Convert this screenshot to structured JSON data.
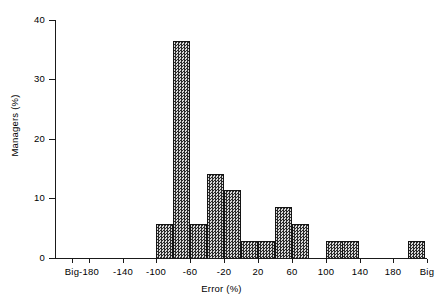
{
  "chart_data": {
    "type": "bar",
    "title": "",
    "subtitle": "",
    "xlabel": "Error (%)",
    "ylabel": "Managers (%)",
    "grid": false,
    "legend": false,
    "xlim": [
      -220,
      220
    ],
    "ylim": [
      0,
      40
    ],
    "ytick_labels": [
      "0",
      "10",
      "20",
      "30",
      "40"
    ],
    "ytick_values": [
      0,
      10,
      20,
      30,
      40
    ],
    "xtick_labels": [
      "Big",
      "-180",
      "-140",
      "-100",
      "-60",
      "-20",
      "20",
      "60",
      "100",
      "140",
      "180",
      "Big"
    ],
    "xtick_values": [
      -200,
      -180,
      -140,
      -100,
      -60,
      -20,
      20,
      60,
      100,
      140,
      180,
      200
    ],
    "bin_width": 20,
    "categories": [
      "-100 to -80",
      "-80 to -60",
      "-60 to -40",
      "-40 to -20",
      "-20 to 0",
      "0 to 20",
      "20 to 40",
      "40 to 60",
      "60 to 80",
      "100 to 120",
      "120 to 140",
      "Big (>=200)"
    ],
    "bin_starts": [
      -100,
      -80,
      -60,
      -40,
      -20,
      0,
      20,
      40,
      60,
      100,
      120,
      197
    ],
    "values": [
      5.7,
      36.5,
      5.7,
      14.1,
      11.4,
      2.9,
      2.9,
      8.6,
      5.7,
      2.9,
      2.9,
      2.9
    ]
  },
  "axes": {
    "y_title": "Managers (%)",
    "x_title": "Error (%)"
  }
}
